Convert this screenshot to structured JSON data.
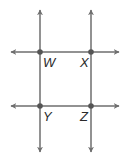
{
  "diagram": {
    "type": "geometry-lines",
    "colors": {
      "line": "#6e6e6e",
      "point": "#555555",
      "label": "#2a2a2a",
      "background": "#ffffff"
    },
    "lines": [
      {
        "id": "vertical-left",
        "orientation": "vertical",
        "x": 40,
        "y1": 10,
        "y2": 152
      },
      {
        "id": "vertical-right",
        "orientation": "vertical",
        "x": 91,
        "y1": 10,
        "y2": 152
      },
      {
        "id": "horizontal-top",
        "orientation": "horizontal",
        "y": 52,
        "x1": 11,
        "x2": 119
      },
      {
        "id": "horizontal-bottom",
        "orientation": "horizontal",
        "y": 106,
        "x1": 11,
        "x2": 119
      }
    ],
    "points": [
      {
        "label": "W",
        "x": 40,
        "y": 52,
        "label_x": 43,
        "label_y": 67
      },
      {
        "label": "X",
        "x": 91,
        "y": 52,
        "label_x": 80,
        "label_y": 67
      },
      {
        "label": "Y",
        "x": 40,
        "y": 106,
        "label_x": 43,
        "label_y": 121
      },
      {
        "label": "Z",
        "x": 91,
        "y": 106,
        "label_x": 80,
        "label_y": 121
      }
    ]
  }
}
